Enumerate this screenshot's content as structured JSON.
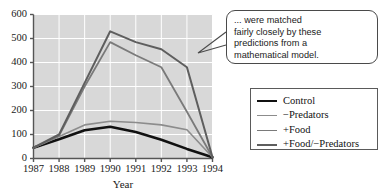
{
  "chart_data": {
    "type": "line",
    "title": "",
    "xlabel": "Year",
    "ylabel": "",
    "x": [
      1987,
      1988,
      1989,
      1990,
      1991,
      1992,
      1993,
      1994
    ],
    "xticklabels": [
      "1987",
      "1988",
      "1989",
      "1990",
      "1991",
      "1992",
      "1993",
      "1994"
    ],
    "yticklabels": [
      "0",
      "100",
      "200",
      "300",
      "400",
      "500",
      "600"
    ],
    "yticks": [
      0,
      100,
      200,
      300,
      400,
      500,
      600
    ],
    "ylim": [
      0,
      600
    ],
    "xlim": [
      1987,
      1994
    ],
    "grid": true,
    "plot_background": "#d8d8d8",
    "grid_color": "#ffffff",
    "legend_position": "right",
    "series": [
      {
        "name": "Control",
        "color": "#111111",
        "width": 2.6,
        "values": [
          45,
          80,
          118,
          132,
          110,
          78,
          40,
          5
        ]
      },
      {
        "name": "−Predators",
        "color": "#8c8c8c",
        "width": 1.6,
        "values": [
          45,
          92,
          140,
          155,
          150,
          140,
          120,
          5
        ]
      },
      {
        "name": "+Food",
        "color": "#7a7a7a",
        "width": 1.8,
        "values": [
          45,
          95,
          300,
          485,
          430,
          380,
          195,
          5
        ]
      },
      {
        "name": "+Food/−Predators",
        "color": "#5e5e5e",
        "width": 2.0,
        "values": [
          45,
          100,
          315,
          530,
          485,
          455,
          380,
          5
        ]
      }
    ]
  },
  "annotation": {
    "name": "callout-note",
    "lines": [
      "... were matched",
      "fairly closely by these",
      "predictions from a",
      "mathematical model."
    ]
  },
  "legend": {
    "items": [
      {
        "label": "Control"
      },
      {
        "label": "−Predators"
      },
      {
        "label": "+Food"
      },
      {
        "label": "+Food/−Predators"
      }
    ]
  }
}
